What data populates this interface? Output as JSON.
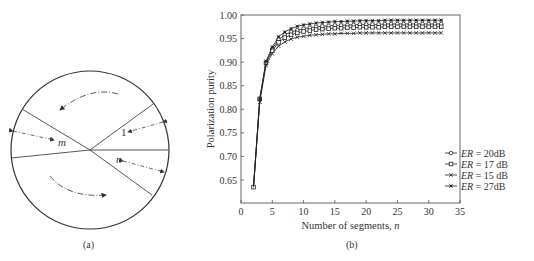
{
  "figure_a": {
    "caption": "(a)",
    "labels": {
      "m": "m",
      "n": "n",
      "one": "1"
    }
  },
  "figure_b": {
    "caption": "(b)"
  },
  "chart_data": {
    "type": "line",
    "title": "",
    "xlabel": "Number of segments, n",
    "ylabel": "Polarization purity",
    "xlim": [
      0,
      35
    ],
    "ylim": [
      0.6,
      1.0
    ],
    "xticks": [
      0,
      5,
      10,
      15,
      20,
      25,
      30,
      35
    ],
    "yticks": [
      0.65,
      0.7,
      0.75,
      0.8,
      0.85,
      0.9,
      0.95,
      1.0
    ],
    "ytick_labels": [
      "0.65",
      "0.70",
      "0.75",
      "0.80",
      "0.85",
      "0.90",
      "0.95",
      "1.00"
    ],
    "grid": false,
    "legend_position": "lower right",
    "x": [
      2,
      3,
      4,
      5,
      6,
      7,
      8,
      9,
      10,
      11,
      12,
      13,
      14,
      15,
      16,
      17,
      18,
      19,
      20,
      21,
      22,
      23,
      24,
      25,
      26,
      27,
      28,
      29,
      30,
      31,
      32
    ],
    "series": [
      {
        "name": "ER = 20dB",
        "marker": "circle",
        "values": [
          0.635,
          0.822,
          0.9,
          0.928,
          0.948,
          0.958,
          0.964,
          0.968,
          0.971,
          0.973,
          0.975,
          0.976,
          0.977,
          0.978,
          0.978,
          0.979,
          0.979,
          0.98,
          0.98,
          0.98,
          0.98,
          0.981,
          0.981,
          0.981,
          0.981,
          0.981,
          0.981,
          0.981,
          0.981,
          0.981,
          0.981
        ]
      },
      {
        "name": "ER = 17 dB",
        "marker": "square",
        "values": [
          0.635,
          0.822,
          0.898,
          0.924,
          0.942,
          0.952,
          0.958,
          0.962,
          0.965,
          0.967,
          0.969,
          0.97,
          0.971,
          0.972,
          0.972,
          0.973,
          0.973,
          0.974,
          0.974,
          0.974,
          0.974,
          0.975,
          0.975,
          0.975,
          0.975,
          0.975,
          0.975,
          0.975,
          0.975,
          0.975,
          0.975
        ]
      },
      {
        "name": "ER = 15 dB",
        "marker": "x",
        "values": [
          0.635,
          0.815,
          0.893,
          0.918,
          0.934,
          0.943,
          0.949,
          0.953,
          0.955,
          0.957,
          0.958,
          0.959,
          0.96,
          0.96,
          0.961,
          0.961,
          0.961,
          0.962,
          0.962,
          0.962,
          0.962,
          0.962,
          0.962,
          0.962,
          0.962,
          0.962,
          0.962,
          0.962,
          0.962,
          0.962,
          0.962
        ]
      },
      {
        "name": "ER = 27dB",
        "marker": "asterisk",
        "values": [
          0.635,
          0.822,
          0.902,
          0.932,
          0.954,
          0.964,
          0.971,
          0.976,
          0.979,
          0.981,
          0.983,
          0.984,
          0.985,
          0.986,
          0.986,
          0.987,
          0.987,
          0.988,
          0.988,
          0.988,
          0.988,
          0.989,
          0.989,
          0.989,
          0.989,
          0.989,
          0.989,
          0.989,
          0.989,
          0.989,
          0.989
        ]
      }
    ],
    "legend": [
      {
        "italic": "ER",
        "rest": " = 20dB",
        "marker": "circle"
      },
      {
        "italic": "ER",
        "rest": " = 17 dB",
        "marker": "square"
      },
      {
        "italic": "ER",
        "rest": " = 15 dB",
        "marker": "x"
      },
      {
        "italic": "ER",
        "rest": " = 27dB",
        "marker": "asterisk"
      }
    ]
  }
}
